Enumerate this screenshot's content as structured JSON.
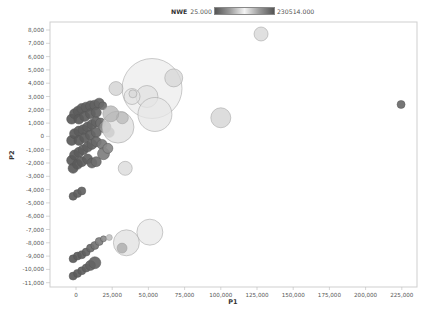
{
  "legend": {
    "name": "NWE",
    "min_label": "25.000",
    "max_label": "230514.000",
    "gradient_stops": [
      "#555555",
      "#9a9a9a",
      "#f4f4f4",
      "#9a9a9a",
      "#555555"
    ]
  },
  "chart_data": {
    "type": "scatter",
    "subtype": "bubble",
    "title": "",
    "xlabel": "P1",
    "ylabel": "P2",
    "xlim": [
      -18000,
      236000
    ],
    "ylim": [
      -11500,
      8600
    ],
    "xticks": [
      0,
      25000,
      50000,
      75000,
      100000,
      125000,
      150000,
      175000,
      200000,
      225000
    ],
    "xtick_labels": [
      "0",
      "25,000",
      "50,000",
      "75,000",
      "100,000",
      "125,000",
      "150,000",
      "175,000",
      "200,000",
      "225,000"
    ],
    "yticks": [
      8000,
      7000,
      6000,
      5000,
      4000,
      3000,
      2000,
      1000,
      0,
      -1000,
      -2000,
      -3000,
      -4000,
      -5000,
      -6000,
      -7000,
      -8000,
      -9000,
      -10000,
      -11000
    ],
    "ytick_labels": [
      "8,000",
      "7,000",
      "6,000",
      "5,000",
      "4,000",
      "3,000",
      "2,000",
      "1,000",
      "0",
      "-1,000",
      "-2,000",
      "-3,000",
      "-4,000",
      "-5,000",
      "-6,000",
      "-7,000",
      "-8,000",
      "-9,000",
      "-10,000",
      "-11,000"
    ],
    "grid": false,
    "legend_position": "top",
    "color_encoding": "NWE",
    "size_encoding": "NWE",
    "series": [
      {
        "name": "dark cluster band 1",
        "points": [
          {
            "x": -3000,
            "y": 1300,
            "r": 5,
            "c": "#5a5a5a"
          },
          {
            "x": -1000,
            "y": 1700,
            "r": 5,
            "c": "#5a5a5a"
          },
          {
            "x": 1500,
            "y": 1900,
            "r": 5,
            "c": "#5c5c5c"
          },
          {
            "x": 4000,
            "y": 2100,
            "r": 5,
            "c": "#5e5e5e"
          },
          {
            "x": 7000,
            "y": 2200,
            "r": 5,
            "c": "#5e5e5e"
          },
          {
            "x": 10000,
            "y": 2300,
            "r": 5,
            "c": "#606060"
          },
          {
            "x": 13000,
            "y": 2350,
            "r": 5,
            "c": "#626262"
          },
          {
            "x": 16000,
            "y": 2500,
            "r": 5,
            "c": "#646464"
          },
          {
            "x": 18500,
            "y": 2300,
            "r": 4,
            "c": "#6a6a6a"
          },
          {
            "x": 2000,
            "y": 1300,
            "r": 5,
            "c": "#5a5a5a"
          },
          {
            "x": 6000,
            "y": 1500,
            "r": 5,
            "c": "#5c5c5c"
          },
          {
            "x": 10000,
            "y": 1700,
            "r": 5,
            "c": "#5e5e5e"
          },
          {
            "x": 14000,
            "y": 1800,
            "r": 5,
            "c": "#626262"
          }
        ]
      },
      {
        "name": "dark cluster band 2",
        "points": [
          {
            "x": -3000,
            "y": -300,
            "r": 5,
            "c": "#5a5a5a"
          },
          {
            "x": -1000,
            "y": 200,
            "r": 5,
            "c": "#5a5a5a"
          },
          {
            "x": 2000,
            "y": 400,
            "r": 5,
            "c": "#5c5c5c"
          },
          {
            "x": 5000,
            "y": 500,
            "r": 5,
            "c": "#5e5e5e"
          },
          {
            "x": 8000,
            "y": 700,
            "r": 5,
            "c": "#5e5e5e"
          },
          {
            "x": 11000,
            "y": 900,
            "r": 5,
            "c": "#606060"
          },
          {
            "x": 14000,
            "y": 1100,
            "r": 5,
            "c": "#646464"
          },
          {
            "x": 17000,
            "y": 1000,
            "r": 5,
            "c": "#6e6e6e"
          },
          {
            "x": 2000,
            "y": -300,
            "r": 5,
            "c": "#5a5a5a"
          },
          {
            "x": 6000,
            "y": -100,
            "r": 5,
            "c": "#5c5c5c"
          },
          {
            "x": 10000,
            "y": 100,
            "r": 5,
            "c": "#606060"
          },
          {
            "x": 14000,
            "y": 300,
            "r": 5,
            "c": "#666666"
          },
          {
            "x": 20000,
            "y": 700,
            "r": 6,
            "c": "#8a8a8a"
          },
          {
            "x": 23000,
            "y": 300,
            "r": 5,
            "c": "#909090"
          }
        ]
      },
      {
        "name": "dark cluster band 3",
        "points": [
          {
            "x": -3000,
            "y": -1800,
            "r": 5,
            "c": "#5a5a5a"
          },
          {
            "x": -1000,
            "y": -1400,
            "r": 5,
            "c": "#5a5a5a"
          },
          {
            "x": 2000,
            "y": -1200,
            "r": 5,
            "c": "#5c5c5c"
          },
          {
            "x": 5000,
            "y": -1000,
            "r": 5,
            "c": "#5e5e5e"
          },
          {
            "x": 8000,
            "y": -800,
            "r": 5,
            "c": "#606060"
          },
          {
            "x": 11000,
            "y": -600,
            "r": 5,
            "c": "#626262"
          },
          {
            "x": 14000,
            "y": -400,
            "r": 5,
            "c": "#686868"
          },
          {
            "x": 18000,
            "y": -600,
            "r": 5,
            "c": "#787878"
          },
          {
            "x": -2000,
            "y": -2400,
            "r": 5,
            "c": "#5a5a5a"
          },
          {
            "x": 1000,
            "y": -2100,
            "r": 5,
            "c": "#5a5a5a"
          },
          {
            "x": 4000,
            "y": -1900,
            "r": 5,
            "c": "#5c5c5c"
          },
          {
            "x": 8000,
            "y": -1700,
            "r": 5,
            "c": "#606060"
          },
          {
            "x": 11000,
            "y": -2000,
            "r": 5,
            "c": "#646464"
          },
          {
            "x": 14000,
            "y": -1900,
            "r": 5,
            "c": "#6e6e6e"
          },
          {
            "x": 19000,
            "y": -1300,
            "r": 6,
            "c": "#7e7e7e"
          },
          {
            "x": 22000,
            "y": -900,
            "r": 5,
            "c": "#8a8a8a"
          }
        ]
      },
      {
        "name": "mid cluster -4000",
        "points": [
          {
            "x": -2000,
            "y": -4500,
            "r": 4,
            "c": "#5c5c5c"
          },
          {
            "x": 1000,
            "y": -4300,
            "r": 4,
            "c": "#5e5e5e"
          },
          {
            "x": 4000,
            "y": -4100,
            "r": 4,
            "c": "#626262"
          }
        ]
      },
      {
        "name": "lower cluster -9000",
        "points": [
          {
            "x": -2000,
            "y": -9200,
            "r": 4,
            "c": "#5a5a5a"
          },
          {
            "x": 1000,
            "y": -9000,
            "r": 4,
            "c": "#5c5c5c"
          },
          {
            "x": 4000,
            "y": -8900,
            "r": 4,
            "c": "#5e5e5e"
          },
          {
            "x": 7000,
            "y": -8700,
            "r": 4,
            "c": "#626262"
          },
          {
            "x": 10000,
            "y": -8400,
            "r": 4,
            "c": "#686868"
          },
          {
            "x": 13000,
            "y": -8200,
            "r": 4,
            "c": "#727272"
          },
          {
            "x": 16000,
            "y": -7900,
            "r": 4,
            "c": "#7e7e7e"
          },
          {
            "x": 19000,
            "y": -7700,
            "r": 3,
            "c": "#8e8e8e"
          }
        ]
      },
      {
        "name": "lower cluster -10000",
        "points": [
          {
            "x": -2000,
            "y": -10500,
            "r": 4,
            "c": "#5a5a5a"
          },
          {
            "x": 1000,
            "y": -10300,
            "r": 4,
            "c": "#5c5c5c"
          },
          {
            "x": 4000,
            "y": -10100,
            "r": 4,
            "c": "#5e5e5e"
          },
          {
            "x": 7000,
            "y": -9900,
            "r": 4,
            "c": "#606060"
          },
          {
            "x": 10000,
            "y": -9700,
            "r": 5,
            "c": "#626262"
          },
          {
            "x": 13000,
            "y": -9500,
            "r": 6,
            "c": "#646464"
          }
        ]
      },
      {
        "name": "large light bubbles",
        "points": [
          {
            "x": 52500,
            "y": 3600,
            "r": 30,
            "c": "#ececec"
          },
          {
            "x": 49000,
            "y": 3000,
            "r": 11,
            "c": "#e0e0e0"
          },
          {
            "x": 54500,
            "y": 1650,
            "r": 17,
            "c": "#e6e6e6"
          },
          {
            "x": 67500,
            "y": 4400,
            "r": 9,
            "c": "#d6d6d6"
          },
          {
            "x": 38700,
            "y": 3000,
            "r": 8,
            "c": "#e2e2e2"
          },
          {
            "x": 39300,
            "y": 3200,
            "r": 4,
            "c": "#d8d8d8"
          },
          {
            "x": 27600,
            "y": 3600,
            "r": 7,
            "c": "#cfcfcf"
          },
          {
            "x": 29000,
            "y": 700,
            "r": 16,
            "c": "#dedede"
          },
          {
            "x": 32000,
            "y": 1400,
            "r": 6,
            "c": "#b8b8b8"
          },
          {
            "x": 24000,
            "y": 1700,
            "r": 8,
            "c": "#b0b0b0"
          },
          {
            "x": 34000,
            "y": -2400,
            "r": 7,
            "c": "#d8d8d8"
          },
          {
            "x": 100000,
            "y": 1400,
            "r": 10,
            "c": "#d2d2d2"
          },
          {
            "x": 127800,
            "y": 7700,
            "r": 7,
            "c": "#d6d6d6"
          },
          {
            "x": 224500,
            "y": 2400,
            "r": 4,
            "c": "#6a6a6a"
          },
          {
            "x": 51000,
            "y": -7200,
            "r": 13,
            "c": "#e8e8e8"
          },
          {
            "x": 34800,
            "y": -8000,
            "r": 13,
            "c": "#e0e0e0"
          },
          {
            "x": 31800,
            "y": -8400,
            "r": 5,
            "c": "#a8a8a8"
          },
          {
            "x": 23000,
            "y": -7600,
            "r": 3,
            "c": "#b4b4b4"
          }
        ]
      }
    ]
  }
}
